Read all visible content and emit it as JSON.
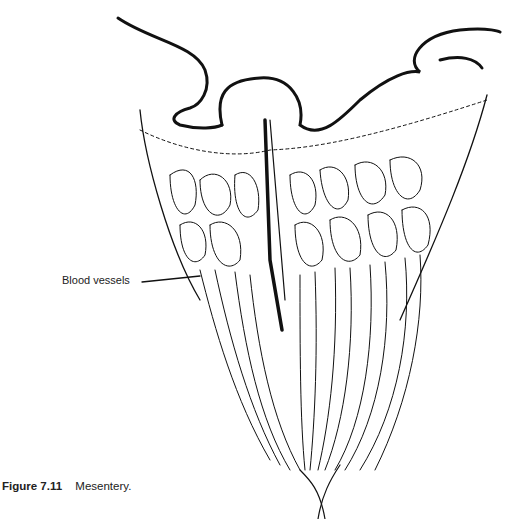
{
  "figure": {
    "caption_number": "Figure 7.11",
    "caption_text": "Mesentery.",
    "labels": [
      {
        "text": "Blood vessels",
        "points_to": "vessel arcades"
      }
    ]
  }
}
